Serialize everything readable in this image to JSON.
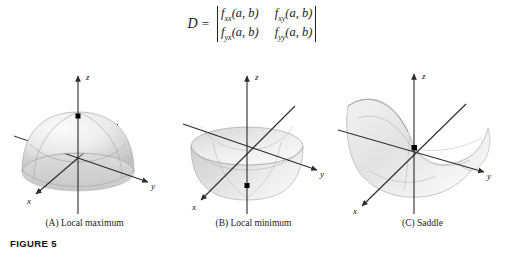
{
  "figure": {
    "label": "FIGURE 5"
  },
  "formula": {
    "lhs": "D",
    "equals": "=",
    "matrix": [
      [
        "f",
        "xx",
        "(a, b)",
        "f",
        "xy",
        "(a, b)"
      ],
      [
        "f",
        "yx",
        "(a, b)",
        "f",
        "yy",
        "(a, b)"
      ]
    ],
    "cells": {
      "r1c1_base": "f",
      "r1c1_sub": "xx",
      "r1c1_arg": "(a, b)",
      "r1c2_base": "f",
      "r1c2_sub": "xy",
      "r1c2_arg": "(a, b)",
      "r2c1_base": "f",
      "r2c1_sub": "yx",
      "r2c1_arg": "(a, b)",
      "r2c2_base": "f",
      "r2c2_sub": "yy",
      "r2c2_arg": "(a, b)"
    }
  },
  "panels": [
    {
      "id": "a",
      "caption": "(A) Local maximum",
      "surface": "dome-paraboloid-downward",
      "critical_point": "maximum",
      "axes": {
        "x": "x",
        "y": "y",
        "z": "z"
      }
    },
    {
      "id": "b",
      "caption": "(B) Local minimum",
      "surface": "bowl-paraboloid-upward",
      "critical_point": "minimum",
      "axes": {
        "x": "x",
        "y": "y",
        "z": "z"
      }
    },
    {
      "id": "c",
      "caption": "(C) Saddle",
      "surface": "hyperbolic-paraboloid",
      "critical_point": "saddle",
      "axes": {
        "x": "x",
        "y": "y",
        "z": "z"
      }
    }
  ],
  "colors": {
    "background": "#ffffff",
    "axis": "#2b2b2b",
    "text": "#1a1a1a",
    "surface_light": "#f2f2f2",
    "surface_mid": "#d9d9d9",
    "surface_dark": "#b8b8b8",
    "gridline": "#9a9a9a",
    "point": "#000000"
  }
}
